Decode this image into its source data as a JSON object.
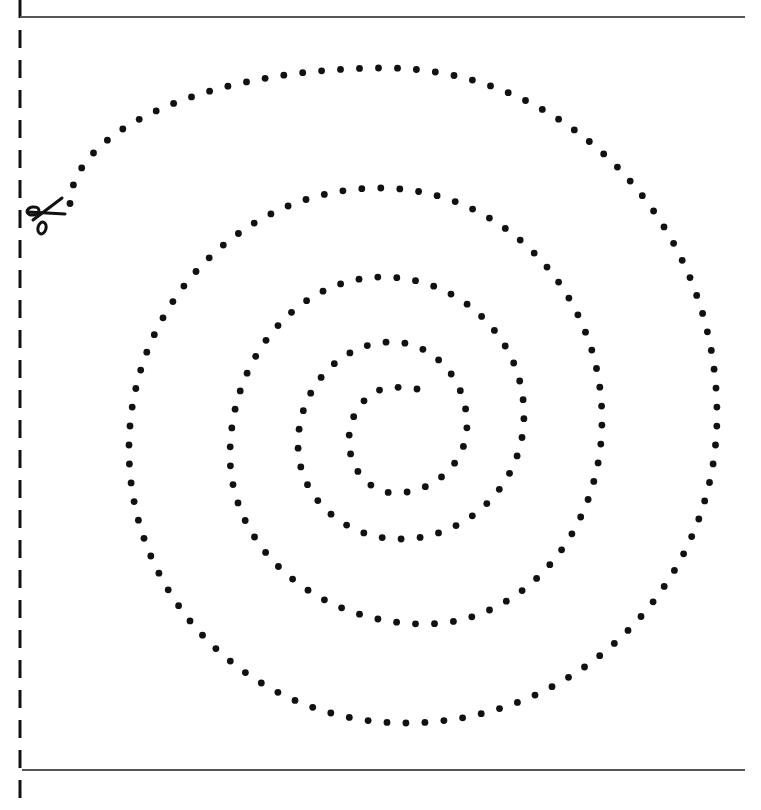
{
  "worksheet": {
    "type": "cut-along-the-dotted-line spiral",
    "colors": {
      "ink": "#111111",
      "guide_line": "#555555",
      "background": "#ffffff"
    },
    "cut_line": {
      "x": 20,
      "y_start": 0,
      "y_end": 810,
      "dash": 18,
      "gap": 12,
      "width": 3
    },
    "top_rule": {
      "y": 17,
      "x_start": 20,
      "x_end": 745
    },
    "bottom_rule": {
      "y": 770,
      "x_start": 22,
      "x_end": 745
    },
    "scissors": {
      "icon": "scissors-icon",
      "x": 45,
      "y": 216
    },
    "spiral": {
      "dot_spacing": 19,
      "dot_radius": 3.4,
      "start": [
        417,
        389
      ],
      "extremes": [
        [
          395,
          387
        ],
        [
          349,
          440
        ],
        [
          395,
          493
        ],
        [
          467,
          425
        ],
        [
          392,
          342
        ],
        [
          298,
          445
        ],
        [
          400,
          539
        ],
        [
          524,
          415
        ],
        [
          383,
          277
        ],
        [
          230,
          455
        ],
        [
          425,
          624
        ],
        [
          602,
          420
        ],
        [
          380,
          188
        ],
        [
          129,
          449
        ],
        [
          405,
          723
        ],
        [
          717,
          415
        ],
        [
          385,
          68
        ],
        [
          70,
          205
        ]
      ]
    }
  }
}
